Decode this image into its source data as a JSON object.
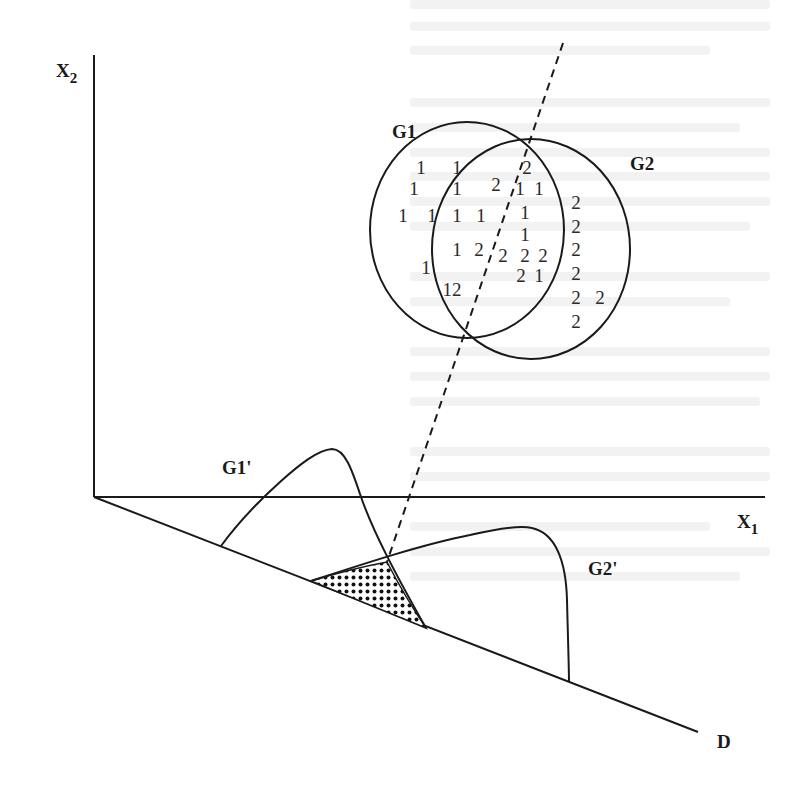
{
  "diagram": {
    "title": "",
    "axes": {
      "x_label": "X",
      "x_sub": "1",
      "y_label": "X",
      "y_sub": "2",
      "projection_label": "D"
    },
    "groups": {
      "g1_label": "G1",
      "g2_label": "G2",
      "g1_projection_label": "G1'",
      "g2_projection_label": "G2'"
    },
    "points": [
      {
        "text": "1",
        "x": 421,
        "y": 174,
        "group": "1"
      },
      {
        "text": "1",
        "x": 457,
        "y": 174,
        "group": "1"
      },
      {
        "text": "2",
        "x": 527,
        "y": 174,
        "group": "2"
      },
      {
        "text": "1",
        "x": 414,
        "y": 195,
        "group": "1"
      },
      {
        "text": "1",
        "x": 457,
        "y": 195,
        "group": "1"
      },
      {
        "text": "2",
        "x": 496,
        "y": 191,
        "group": "2"
      },
      {
        "text": "1",
        "x": 520,
        "y": 195,
        "group": "1"
      },
      {
        "text": "1",
        "x": 539,
        "y": 195,
        "group": "1"
      },
      {
        "text": "1",
        "x": 403,
        "y": 222,
        "group": "1"
      },
      {
        "text": "1",
        "x": 432,
        "y": 222,
        "group": "1"
      },
      {
        "text": "1",
        "x": 457,
        "y": 222,
        "group": "1"
      },
      {
        "text": "1",
        "x": 481,
        "y": 222,
        "group": "1"
      },
      {
        "text": "1",
        "x": 525,
        "y": 219,
        "group": "1"
      },
      {
        "text": "1",
        "x": 525,
        "y": 241,
        "group": "1"
      },
      {
        "text": "1",
        "x": 457,
        "y": 256,
        "group": "1"
      },
      {
        "text": "2",
        "x": 479,
        "y": 256,
        "group": "2"
      },
      {
        "text": "2",
        "x": 503,
        "y": 262,
        "group": "2"
      },
      {
        "text": "2",
        "x": 525,
        "y": 262,
        "group": "2"
      },
      {
        "text": "2",
        "x": 543,
        "y": 262,
        "group": "2"
      },
      {
        "text": "1",
        "x": 426,
        "y": 274,
        "group": "1"
      },
      {
        "text": "2",
        "x": 521,
        "y": 282,
        "group": "2"
      },
      {
        "text": "1",
        "x": 539,
        "y": 282,
        "group": "1"
      },
      {
        "text": "12",
        "x": 452,
        "y": 296,
        "group": "mixed"
      },
      {
        "text": "2",
        "x": 576,
        "y": 209,
        "group": "2"
      },
      {
        "text": "2",
        "x": 576,
        "y": 233,
        "group": "2"
      },
      {
        "text": "2",
        "x": 576,
        "y": 256,
        "group": "2"
      },
      {
        "text": "2",
        "x": 576,
        "y": 280,
        "group": "2"
      },
      {
        "text": "2",
        "x": 576,
        "y": 304,
        "group": "2"
      },
      {
        "text": "2",
        "x": 600,
        "y": 304,
        "group": "2"
      },
      {
        "text": "2",
        "x": 576,
        "y": 328,
        "group": "2"
      }
    ],
    "shaded_region": "overlap of G1' and G2' projected distributions (misclassification area)"
  }
}
